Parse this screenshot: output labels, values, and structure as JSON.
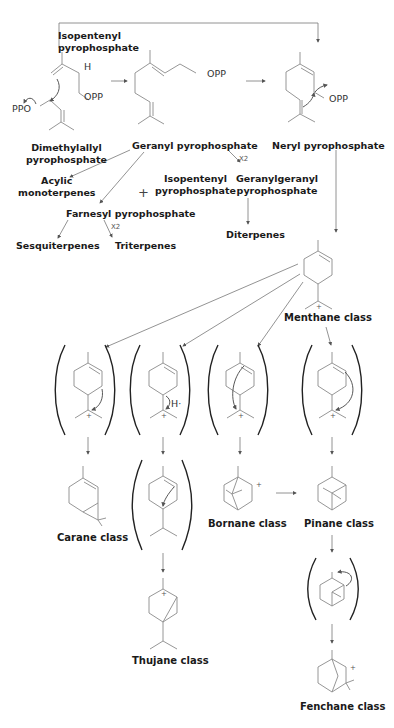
{
  "molecules": {
    "isopentenyl_pp_top": "Isopentenyl\npyrophosphate",
    "dimethylallyl_pp": "Dimethylallyl\npyrophosphate",
    "geranyl_pp": "Geranyl pyrophosphate",
    "neryl_pp": "Neryl pyrophosphate",
    "acyclic_monoterpenes": "Acylic\nmonoterpenes",
    "isopentenyl_pp_mid": "Isopentenyl\npyrophosphate",
    "geranylgeranyl_pp": "Geranylgeranyl\npyrophosphate",
    "farnesyl_pp": "Farnesyl pyrophosphate",
    "sesquiterpenes": "Sesquiterpenes",
    "triterpenes": "Triterpenes",
    "diterpenes": "Diterpenes"
  },
  "classes": {
    "menthane": "Menthane class",
    "carane": "Carane class",
    "thujane": "Thujane class",
    "bornane": "Bornane class",
    "pinane": "Pinane class",
    "fenchane": "Fenchane class"
  },
  "atoms": {
    "h_ipp": "H",
    "opp_ipp": "OPP",
    "ppo_dmapp": "PPO",
    "opp_gpp": "OPP",
    "opp_npp": "OPP",
    "h_thujane": "H·"
  },
  "annotations": {
    "x2_ggpp": "X2",
    "x2_tri": "X2",
    "plus": "+",
    "cation": "+"
  }
}
